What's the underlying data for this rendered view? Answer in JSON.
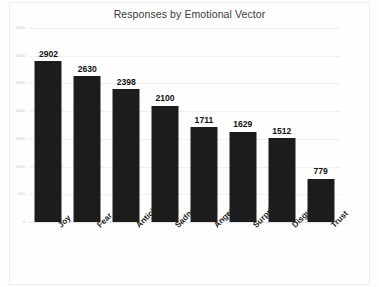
{
  "chart_data": {
    "type": "bar",
    "title": "Responses by Emotional Vector",
    "xlabel": "",
    "ylabel": "",
    "categories": [
      "Joy",
      "Fear",
      "Anticipation",
      "Sadness",
      "Anger",
      "Surprise",
      "Disgust",
      "Trust"
    ],
    "values": [
      2902,
      2630,
      2398,
      2100,
      1711,
      1629,
      1512,
      779
    ],
    "data_labels": [
      "2902",
      "2630",
      "2398",
      "2100",
      "1711",
      "1629",
      "1512",
      "779"
    ],
    "ylim": [
      0,
      3500
    ],
    "ytick_values": [
      0,
      500,
      1000,
      1500,
      2000,
      2500,
      3000,
      3500
    ],
    "ytick_labels": [
      "0",
      "500",
      "1000",
      "1500",
      "2000",
      "2500",
      "3000",
      "3500"
    ],
    "grid": true,
    "legend": false,
    "legend_position": "none",
    "bar_color": "#1c1c1c",
    "gridline_color": "#f0f0f0",
    "axis_color": "#e2e2e2",
    "title_color": "#3b3b3b",
    "ytick_label_color": "#c9c9c9",
    "xtick_label_rotation": -45
  }
}
